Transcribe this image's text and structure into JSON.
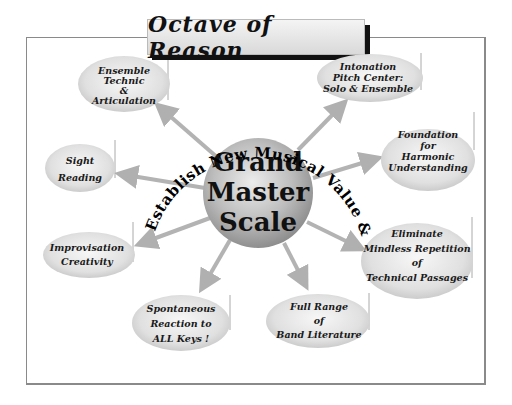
{
  "title": "Octave of Reason",
  "center": {
    "lines": [
      "Grand",
      "Master",
      "Scale"
    ]
  },
  "arc_caption": "Establish New Musical Value & Worth !",
  "nodes": [
    {
      "id": "ensemble-technic",
      "lines": [
        "Ensemble",
        "Technic",
        "&",
        "Articulation"
      ]
    },
    {
      "id": "intonation",
      "lines": [
        "Intonation",
        "Pitch Center:",
        "Solo & Ensemble"
      ]
    },
    {
      "id": "sight-reading",
      "lines": [
        "Sight",
        "Reading"
      ]
    },
    {
      "id": "foundation-harmonic",
      "lines": [
        "Foundation",
        "for",
        "Harmonic",
        "Understanding"
      ]
    },
    {
      "id": "improvisation",
      "lines": [
        "Improvisation",
        "Creativity"
      ]
    },
    {
      "id": "eliminate-repetition",
      "lines": [
        "Eliminate",
        "Mindless Repetition",
        "of",
        "Technical Passages"
      ]
    },
    {
      "id": "spontaneous-reaction",
      "lines": [
        "Spontaneous",
        "Reaction to",
        "ALL Keys !"
      ]
    },
    {
      "id": "full-range",
      "lines": [
        "Full Range",
        "of",
        "Band Literature"
      ]
    }
  ],
  "colors": {
    "arrow": "#b0b0b0",
    "bubble_light": "#f2f2f2",
    "bubble_dark": "#c8c8c8",
    "sphere_light": "#e6e6e6",
    "sphere_dark": "#8c8c8c",
    "frame": "#8a8a8a",
    "text": "#111111"
  }
}
